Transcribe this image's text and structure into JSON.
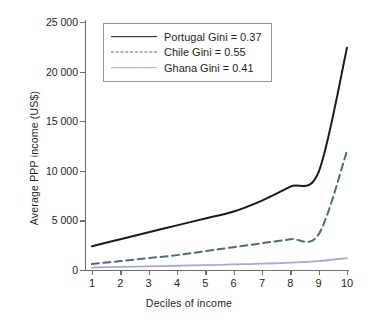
{
  "chart_data": {
    "type": "line",
    "title": "",
    "xlabel": "Deciles of income",
    "ylabel": "Average PPP income (US$)",
    "categories": [
      "1",
      "2",
      "3",
      "4",
      "5",
      "6",
      "7",
      "8",
      "9",
      "10"
    ],
    "x": [
      1,
      2,
      3,
      4,
      5,
      6,
      7,
      8,
      9,
      10
    ],
    "xlim": [
      1,
      10
    ],
    "ylim": [
      0,
      25000
    ],
    "yticks": [
      0,
      5000,
      10000,
      15000,
      20000,
      25000
    ],
    "ytick_labels": [
      "0",
      "5 000",
      "10 000",
      "15 000",
      "20 000",
      "25 000"
    ],
    "xticks": [
      1,
      2,
      3,
      4,
      5,
      6,
      7,
      8,
      9,
      10
    ],
    "xtick_labels": [
      "1",
      "2",
      "3",
      "4",
      "5",
      "6",
      "7",
      "8",
      "9",
      "10"
    ],
    "grid": false,
    "legend_position": "top-left",
    "series": [
      {
        "name": "Portugal",
        "label": "Portugal Gini = 0.37",
        "gini": "0.37",
        "color": "#1a1a1a",
        "style": "solid",
        "width": 2.0,
        "values": [
          2400,
          3100,
          3800,
          4500,
          5200,
          5900,
          7000,
          8400,
          9900,
          22400
        ]
      },
      {
        "name": "Chile",
        "label": "Chile Gini = 0.55",
        "gini": "0.55",
        "color": "#4a6f73",
        "style": "dashed",
        "width": 2.0,
        "values": [
          600,
          900,
          1200,
          1500,
          1900,
          2300,
          2700,
          3100,
          3600,
          12000
        ]
      },
      {
        "name": "Ghana",
        "label": "Ghana Gini = 0.41",
        "gini": "0.41",
        "color": "#a9a8d6",
        "style": "solid",
        "width": 1.8,
        "values": [
          250,
          310,
          370,
          430,
          490,
          560,
          640,
          740,
          900,
          1200
        ]
      }
    ]
  }
}
